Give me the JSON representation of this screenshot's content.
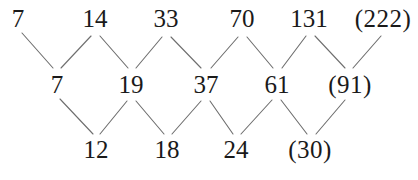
{
  "figure": {
    "kind": "difference-table-zigzag",
    "line_color": "#6e6e6e",
    "text_color": "#1a1a1a",
    "background": "#ffffff"
  },
  "rows": [
    {
      "name": "sequence",
      "cells": [
        {
          "text": "7",
          "x": 18,
          "predicted": false
        },
        {
          "text": "14",
          "x": 95,
          "predicted": false
        },
        {
          "text": "33",
          "x": 166,
          "predicted": false
        },
        {
          "text": "70",
          "x": 242,
          "predicted": false
        },
        {
          "text": "131",
          "x": 309,
          "predicted": false
        },
        {
          "text": "(222)",
          "x": 383,
          "predicted": true
        }
      ]
    },
    {
      "name": "first-differences",
      "cells": [
        {
          "text": "7",
          "x": 57,
          "predicted": false
        },
        {
          "text": "19",
          "x": 131,
          "predicted": false
        },
        {
          "text": "37",
          "x": 206,
          "predicted": false
        },
        {
          "text": "61",
          "x": 277,
          "predicted": false
        },
        {
          "text": "(91)",
          "x": 350,
          "predicted": true
        }
      ]
    },
    {
      "name": "second-differences",
      "cells": [
        {
          "text": "12",
          "x": 96,
          "predicted": false
        },
        {
          "text": "18",
          "x": 167,
          "predicted": false
        },
        {
          "text": "24",
          "x": 236,
          "predicted": false
        },
        {
          "text": "(30)",
          "x": 310,
          "predicted": true
        }
      ]
    }
  ],
  "chart_data": {
    "type": "table",
    "title": "",
    "xlabel": "",
    "ylabel": "",
    "series": [
      {
        "name": "sequence",
        "values": [
          7,
          14,
          33,
          70,
          131,
          222
        ]
      },
      {
        "name": "first differences",
        "values": [
          7,
          19,
          37,
          61,
          91
        ]
      },
      {
        "name": "second differences",
        "values": [
          12,
          18,
          24,
          30
        ]
      }
    ],
    "predicted_values": [
      222,
      91,
      30
    ],
    "annotations": [
      "parenthesised values are extrapolated",
      "each middle value is the difference of the two values above it",
      "each bottom value is the difference of the two values above it"
    ]
  },
  "lines": {
    "top_to_middle": [
      "M22,33 L53,68",
      "M61,68 L91,36",
      "M100,36 L128,68",
      "M136,68 L162,37",
      "M171,37 L201,68",
      "M211,68 L238,37",
      "M247,37 L273,68",
      "M282,68 L306,36",
      "M315,36 L345,68",
      "M353,68 L381,36"
    ],
    "middle_to_bottom": [
      "M60,99 L93,134",
      "M100,134 L127,101",
      "M136,101 L164,134",
      "M172,134 L201,101",
      "M210,101 L233,134",
      "M241,134 L272,100",
      "M281,100 L307,134",
      "M316,134 L345,100"
    ]
  }
}
